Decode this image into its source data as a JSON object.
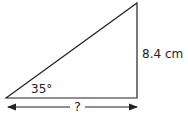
{
  "diagram": {
    "type": "right-triangle",
    "angle_label": "35°",
    "opposite_side_label": "8.4 cm",
    "adjacent_side_label": "?",
    "colors": {
      "stroke": "#222222",
      "background": "#ffffff"
    }
  }
}
